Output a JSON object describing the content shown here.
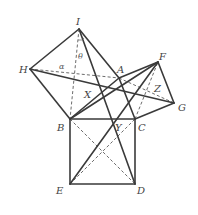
{
  "figure": {
    "points": {
      "I": [
        79,
        29
      ],
      "H": [
        30,
        69
      ],
      "A": [
        119,
        78
      ],
      "F": [
        158,
        62
      ],
      "G": [
        174,
        103
      ],
      "B": [
        70,
        119
      ],
      "C": [
        135,
        119
      ],
      "E": [
        70,
        184
      ],
      "D": [
        135,
        184
      ]
    },
    "labels": {
      "I": "I",
      "H": "H",
      "A": "A",
      "F": "F",
      "G": "G",
      "B": "B",
      "C": "C",
      "E": "E",
      "D": "D",
      "X": "X",
      "Y": "Y",
      "Z": "Z",
      "alpha": "α",
      "theta": "θ"
    },
    "solid_segments": [
      [
        "B",
        "C"
      ],
      [
        "C",
        "D"
      ],
      [
        "D",
        "E"
      ],
      [
        "E",
        "B"
      ],
      [
        "A",
        "B"
      ],
      [
        "A",
        "C"
      ],
      [
        "B",
        "H"
      ],
      [
        "H",
        "I"
      ],
      [
        "I",
        "A"
      ],
      [
        "A",
        "F"
      ],
      [
        "F",
        "G"
      ],
      [
        "G",
        "C"
      ],
      [
        "H",
        "G"
      ],
      [
        "B",
        "F"
      ],
      [
        "E",
        "F"
      ],
      [
        "I",
        "D"
      ]
    ],
    "dashed_segments": [
      [
        "I",
        "B"
      ],
      [
        "H",
        "A"
      ],
      [
        "A",
        "G"
      ],
      [
        "C",
        "F"
      ],
      [
        "B",
        "D"
      ],
      [
        "E",
        "C"
      ]
    ],
    "colors": {
      "line": "#3a3a3a",
      "dash": "#5a5a5a",
      "label": "#444444"
    }
  }
}
